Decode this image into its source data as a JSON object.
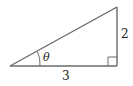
{
  "diagram": {
    "type": "right-triangle",
    "angle_label": "θ",
    "adjacent_label": "3",
    "opposite_label": "2",
    "right_angle_marker": true,
    "vertices": {
      "angle_vertex": [
        10,
        66
      ],
      "right_angle_vertex": [
        117,
        66
      ],
      "top_vertex": [
        117,
        7
      ]
    },
    "colors": {
      "stroke": "#6a6a6a",
      "text": "#222222",
      "background": "#ffffff"
    }
  }
}
